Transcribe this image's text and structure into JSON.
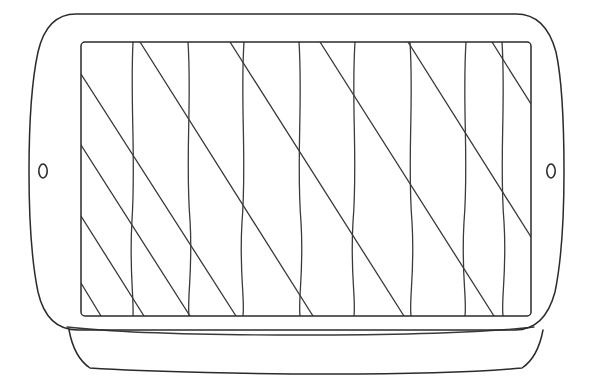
{
  "image": {
    "kind": "hand-drawn-line-sketch",
    "subject": "rectangular grill pan / baking tray with side handles",
    "width": 592,
    "height": 381,
    "background_color": "#ffffff",
    "ink_color": "#2b2b2b",
    "stroke_width": 1.5
  },
  "drawing": {
    "outer_body": {
      "name": "tray-outline",
      "description": "rounded rectangle body with bulging curved left and right handle ends",
      "path": "M 76 14 L 516 14 C 535 14 549 26 556 52 C 563 84 564 130 564 172 C 564 214 562 258 555 292 C 548 318 534 330 515 330 L 78 330 C 58 330 44 318 38 292 C 31 258 29 214 29 172 C 29 130 31 84 38 52 C 44 26 57 14 76 14 Z"
    },
    "inner_panel": {
      "name": "cooking-surface",
      "description": "inner rectangle cooking surface",
      "left": 81,
      "top": 42,
      "right": 531,
      "bottom": 316,
      "corner_radius": 4
    },
    "base_band": {
      "name": "tray-base",
      "description": "lower base band beneath the tray rim",
      "rim_path": "M 67 327 C 120 333 200 335 300 335 C 400 335 480 333 534 327",
      "band_path": "M 69 330 C 72 346 78 360 90 368 C 150 372 260 374 330 374 C 410 374 480 372 522 368 C 534 360 540 346 543 330"
    },
    "handle_holes": [
      {
        "name": "handle-hole-left",
        "cx": 43,
        "cy": 171,
        "rx": 4.2,
        "ry": 7.0
      },
      {
        "name": "handle-hole-right",
        "cx": 551,
        "cy": 171,
        "rx": 4.2,
        "ry": 7.0
      }
    ],
    "vertical_ribs": {
      "name": "vertical-ribs",
      "count": 8,
      "description": "hand-drawn slightly wavy vertical lines spanning the cooking surface",
      "paths": [
        "M 133 42 C 130 100 136 160 132 220 C 129 270 134 296 133 316",
        "M 188 42 C 192 100 185 160 190 220 C 193 270 187 298 189 316",
        "M 244 42 C 240 100 247 162 242 222 C 239 272 245 298 243 316",
        "M 299 42 C 303 102 296 162 301 222 C 304 272 298 298 300 316",
        "M 355 42 C 351 102 358 162 353 222 C 350 272 356 298 354 316",
        "M 410 42 C 414 102 407 162 412 222 C 415 272 409 298 411 316",
        "M 466 42 C 462 102 469 162 464 222 C 461 272 467 298 465 316",
        "M 502 42 C 506 102 499 162 504 222 C 507 272 501 298 503 316"
      ]
    },
    "diagonal_ribs": {
      "name": "diagonal-ribs",
      "count": 9,
      "direction": "top-left to bottom-right",
      "description": "parallel diagonal ridge lines crossing the vertical ribs",
      "paths": [
        "M 81 74 L 236 316",
        "M 81 145 L 190 316",
        "M 81 216 L 144 316",
        "M 81 283 L 101 316",
        "M 140 42 L 313 316",
        "M 230 42 L 404 316",
        "M 320 42 L 494 316",
        "M 408 42 L 531 237",
        "M 492 42 L 531 104"
      ]
    }
  },
  "labels": {
    "title": "",
    "caption": ""
  }
}
